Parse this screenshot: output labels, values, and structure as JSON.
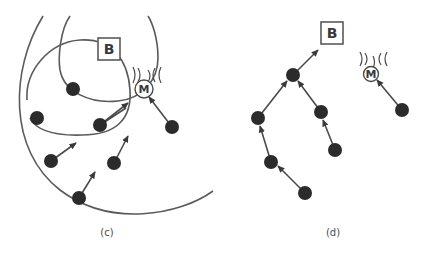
{
  "panels": [
    {
      "id": "c",
      "caption": "(c)",
      "base_station_label": "B",
      "mobile_label": "M",
      "node_count": 7
    },
    {
      "id": "d",
      "caption": "(d)",
      "base_station_label": "B",
      "mobile_label": "M",
      "node_count": 6
    }
  ],
  "colors": {
    "node": "#2b2b2b",
    "line": "#4a4a4a",
    "background": "#ffffff"
  }
}
